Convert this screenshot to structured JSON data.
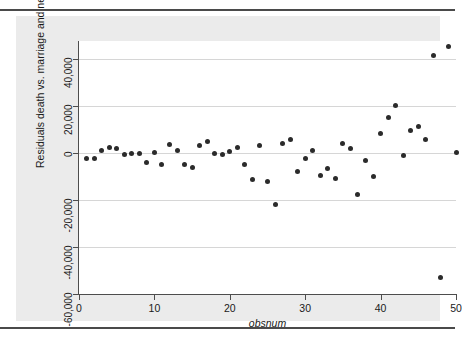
{
  "figure": {
    "background_color": "#ebebeb",
    "plot_background_color": "#ffffff",
    "marker_color": "#2b2b2b",
    "grid_color": "#d6d6d6",
    "axis_color": "#4d4d4d",
    "rule_color": "#4a4a4a"
  },
  "chart_data": {
    "type": "scatter",
    "title": "",
    "xlabel": "obsnum",
    "ylabel": "Residuals death vs. marriage and nevada_dummy",
    "xlim": [
      0,
      50
    ],
    "ylim": [
      -60000,
      45000
    ],
    "xticks": [
      0,
      10,
      20,
      30,
      40,
      50
    ],
    "xtick_labels": [
      "0",
      "10",
      "20",
      "30",
      "40",
      "50"
    ],
    "yticks": [
      40000,
      20000,
      0,
      -20000,
      -40000,
      -60000
    ],
    "ytick_labels": [
      "40,000",
      "20,000",
      "0",
      "-20,000",
      "-40,000",
      "-60,000"
    ],
    "grid": "horizontal",
    "legend": "none",
    "marker": "filled-circle",
    "x": [
      1,
      2,
      3,
      4,
      5,
      6,
      7,
      8,
      9,
      10,
      11,
      12,
      13,
      14,
      15,
      16,
      17,
      18,
      19,
      20,
      21,
      22,
      23,
      24,
      25,
      26,
      27,
      28,
      29,
      30,
      31,
      32,
      33,
      34,
      35,
      36,
      37,
      38,
      39,
      40,
      41,
      42,
      43,
      44,
      45,
      46,
      47,
      48,
      49,
      50
    ],
    "y": [
      -2500,
      -2200,
      1200,
      2200,
      1900,
      -600,
      -300,
      -400,
      -4200,
      400,
      -5000,
      3800,
      1100,
      -5000,
      -6200,
      3000,
      4700,
      -200,
      -700,
      600,
      2200,
      -4800,
      -11300,
      3000,
      -12300,
      -21800,
      4000,
      5900,
      -7800,
      -2500,
      1000,
      -9500,
      -6700,
      -10700,
      4000,
      1900,
      -17500,
      -3200,
      -10100,
      8300,
      15300,
      20400,
      -1200,
      9600,
      11100,
      5900,
      41400,
      -53000,
      45200,
      200
    ]
  },
  "axes": {
    "x_title": "obsnum",
    "y_title": "Residuals death vs. marriage and nevada_dummy"
  }
}
